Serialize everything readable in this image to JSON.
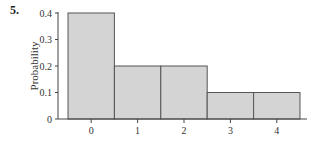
{
  "problem_number": "5.",
  "chart_data": {
    "type": "bar",
    "title": "",
    "xlabel": "",
    "ylabel": "Probability",
    "categories": [
      "0",
      "1",
      "2",
      "3",
      "4"
    ],
    "values": [
      0.4,
      0.2,
      0.2,
      0.1,
      0.1
    ],
    "ylim": [
      0,
      0.4
    ],
    "yticks": [
      "0",
      "0.1",
      "0.2",
      "0.3",
      "0.4"
    ],
    "grid": false,
    "bar_color": "#d4d4d4",
    "bar_edge_color": "#555555",
    "histogram_style": true
  }
}
